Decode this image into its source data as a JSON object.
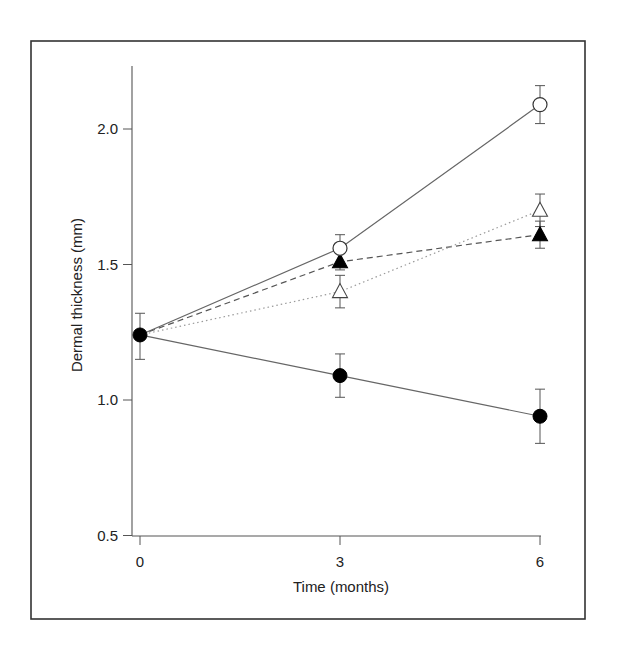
{
  "chart_data": {
    "type": "line",
    "title": "",
    "xlabel": "Time (months)",
    "ylabel": "Dermal thickness (mm)",
    "x": [
      0,
      3,
      6
    ],
    "xticks": [
      "0",
      "3",
      "6"
    ],
    "yticks": [
      "0.5",
      "1.0",
      "1.5",
      "2.0"
    ],
    "ytick_values": [
      0.5,
      1.0,
      1.5,
      2.0
    ],
    "ylim": [
      0.5,
      2.25
    ],
    "xlim": [
      0,
      6
    ],
    "grid": false,
    "legend": "none",
    "series": [
      {
        "name": "open circles",
        "marker": "circle-open",
        "line": "solid",
        "color": "#666666",
        "values": [
          1.24,
          1.56,
          2.09
        ],
        "err_low": [
          1.15,
          1.5,
          2.02
        ],
        "err_high": [
          1.32,
          1.61,
          2.16
        ]
      },
      {
        "name": "filled triangles",
        "marker": "triangle-filled",
        "line": "dashed",
        "color": "#555555",
        "values": [
          1.24,
          1.51,
          1.61
        ],
        "err_low": [
          1.15,
          1.48,
          1.56
        ],
        "err_high": [
          1.32,
          1.54,
          1.66
        ]
      },
      {
        "name": "open triangles",
        "marker": "triangle-open",
        "line": "dotted",
        "color": "#9a9a9a",
        "values": [
          1.24,
          1.4,
          1.7
        ],
        "err_low": [
          1.15,
          1.34,
          1.64
        ],
        "err_high": [
          1.32,
          1.46,
          1.76
        ]
      },
      {
        "name": "filled circles",
        "marker": "circle-filled",
        "line": "solid",
        "color": "#666666",
        "values": [
          1.24,
          1.09,
          0.94
        ],
        "err_low": [
          1.15,
          1.01,
          0.84
        ],
        "err_high": [
          1.32,
          1.17,
          1.04
        ]
      }
    ]
  }
}
